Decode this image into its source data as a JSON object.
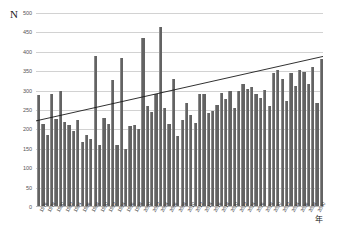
{
  "chart_data": {
    "type": "bar",
    "title": "",
    "ylabel": "N",
    "xlabel": "年",
    "ylim": [
      0,
      500
    ],
    "ytick_labels": [
      "0",
      "50",
      "100",
      "150",
      "200",
      "250",
      "300",
      "350",
      "400",
      "450",
      "500"
    ],
    "ytick_values": [
      0,
      50,
      100,
      150,
      200,
      250,
      300,
      350,
      400,
      450,
      500
    ],
    "grid": true,
    "legend": "none",
    "xtick_step": 2,
    "categories": [
      "1976",
      "1977",
      "1978",
      "1979",
      "1980",
      "1981",
      "1982",
      "1983",
      "1984",
      "1985",
      "1986",
      "1987",
      "1988",
      "1989",
      "1990",
      "1991",
      "1992",
      "1993",
      "1994",
      "1995",
      "1996",
      "1997",
      "1998",
      "1999",
      "2000",
      "2001",
      "2002",
      "2003",
      "2004",
      "2005",
      "2006",
      "2007",
      "2008",
      "2009",
      "2010",
      "2011",
      "2012",
      "2013",
      "2014",
      "2015",
      "2016",
      "2017",
      "2018",
      "2019",
      "2020",
      "2021",
      "2022",
      "2023",
      "2024",
      "2025",
      "2026",
      "2027",
      "2028",
      "2029",
      "2030",
      "2031",
      "2032",
      "2033",
      "2034",
      "2035",
      "2036",
      "2037",
      "2038",
      "2039",
      "2040",
      "2041"
    ],
    "tick_labels_visible": [
      "1976",
      "1978",
      "1980",
      "1982",
      "1984",
      "1986",
      "1988",
      "1990",
      "1992",
      "1994",
      "1996",
      "1998",
      "2000",
      "2002",
      "2004",
      "2006",
      "2008",
      "2010",
      "2012",
      "2014",
      "2016",
      "2018",
      "2020",
      "2022"
    ],
    "values": [
      288,
      215,
      185,
      292,
      228,
      298,
      218,
      212,
      195,
      225,
      168,
      186,
      176,
      390,
      160,
      230,
      215,
      328,
      160,
      383,
      150,
      210,
      212,
      200,
      435,
      260,
      245,
      290,
      465,
      255,
      215,
      330,
      182,
      225,
      268,
      238,
      216,
      290,
      290,
      243,
      248,
      262,
      295,
      278,
      298,
      256,
      300,
      318,
      305,
      310,
      290,
      282,
      302,
      260,
      345,
      352,
      330,
      272,
      345,
      312,
      352,
      348,
      318,
      362,
      268,
      382
    ],
    "series": [
      {
        "name": "N",
        "type": "bar",
        "color": "#636363"
      },
      {
        "name": "trend",
        "type": "line",
        "color": "#1a1a1a",
        "y_start": 222,
        "y_end": 388
      }
    ]
  }
}
